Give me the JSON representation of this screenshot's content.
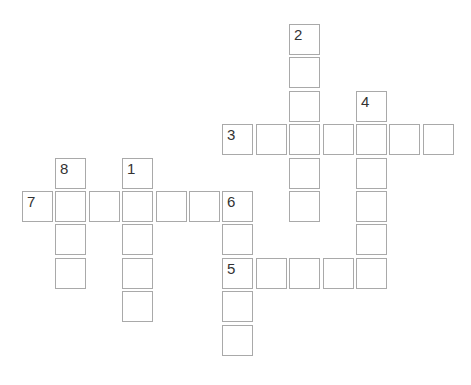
{
  "puzzle": {
    "grid": {
      "origin_x": 22,
      "origin_y": 24,
      "pitch": 33.4
    },
    "colors": {
      "cell_border": "#a9a9a9",
      "cell_fill": "#ffffff",
      "number": "#333333",
      "background": "#ffffff"
    },
    "clues": [
      {
        "number": "1",
        "direction": "down",
        "row": 4,
        "col": 3,
        "length": 5
      },
      {
        "number": "2",
        "direction": "down",
        "row": 0,
        "col": 8,
        "length": 6
      },
      {
        "number": "3",
        "direction": "across",
        "row": 3,
        "col": 6,
        "length": 7
      },
      {
        "number": "4",
        "direction": "down",
        "row": 2,
        "col": 10,
        "length": 6
      },
      {
        "number": "5",
        "direction": "across",
        "row": 7,
        "col": 6,
        "length": 5
      },
      {
        "number": "6",
        "direction": "down",
        "row": 5,
        "col": 6,
        "length": 5
      },
      {
        "number": "7",
        "direction": "across",
        "row": 5,
        "col": 0,
        "length": 7
      },
      {
        "number": "8",
        "direction": "down",
        "row": 4,
        "col": 1,
        "length": 4
      }
    ]
  }
}
